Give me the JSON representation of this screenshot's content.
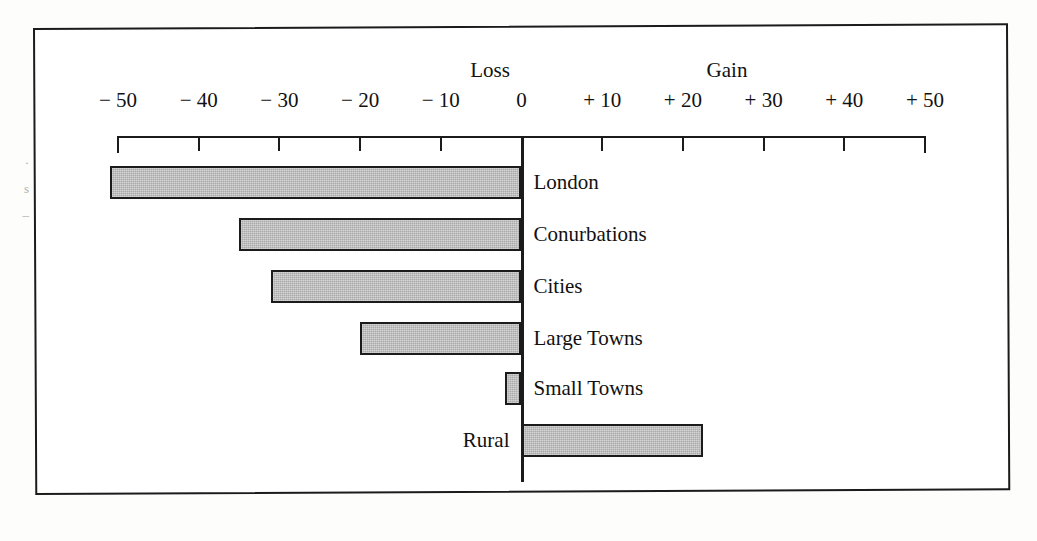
{
  "figure": {
    "margin_marks": [
      "·",
      "s",
      "–"
    ]
  },
  "chart_data": {
    "type": "bar",
    "orientation": "horizontal",
    "title": "",
    "subtitle": "",
    "xlabel": "",
    "ylabel": "",
    "grid": false,
    "legend_position": "none",
    "xlim": [
      -50,
      50
    ],
    "zero_line": true,
    "direction_labels": {
      "negative": "Loss",
      "positive": "Gain"
    },
    "tick_values": [
      -50,
      -40,
      -30,
      -20,
      -10,
      0,
      10,
      20,
      30,
      40,
      50
    ],
    "tick_labels": [
      "− 50",
      "− 40",
      "− 30",
      "− 20",
      "− 10",
      "0",
      "+ 10",
      "+ 20",
      "+ 30",
      "+ 40",
      "+ 50"
    ],
    "categories": [
      "London",
      "Conurbations",
      "Cities",
      "Large Towns",
      "Small Towns",
      "Rural"
    ],
    "values": [
      -51,
      -35,
      -31,
      -20,
      -2,
      22.5
    ],
    "series": [
      {
        "name": "Net migration",
        "values": [
          -51,
          -35,
          -31,
          -20,
          -2,
          22.5
        ]
      }
    ],
    "bar_color": "#a9a9a9",
    "bar_edge_color": "#1b1b1b"
  }
}
